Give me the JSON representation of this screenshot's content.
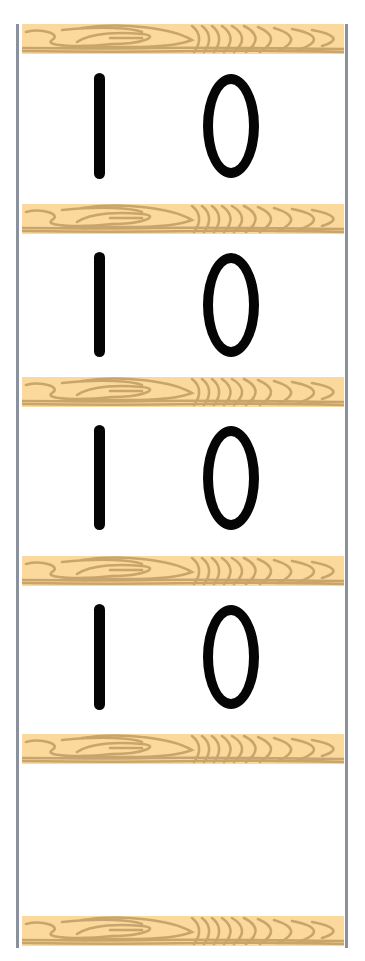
{
  "colors": {
    "background": "#ffffff",
    "rail": "#8a919c",
    "wood_light": "#fbd99c",
    "wood_grain": "#c9a56b",
    "digit": "#050505"
  },
  "shelves": [
    {
      "top": 24
    },
    {
      "top": 204
    },
    {
      "top": 377
    },
    {
      "top": 556
    },
    {
      "top": 734
    },
    {
      "top": 916
    }
  ],
  "rows": [
    {
      "number": "10",
      "tens": "1",
      "ones": "0"
    },
    {
      "number": "10",
      "tens": "1",
      "ones": "0"
    },
    {
      "number": "10",
      "tens": "1",
      "ones": "0"
    },
    {
      "number": "10",
      "tens": "1",
      "ones": "0"
    },
    {
      "number": "",
      "tens": "",
      "ones": ""
    }
  ]
}
